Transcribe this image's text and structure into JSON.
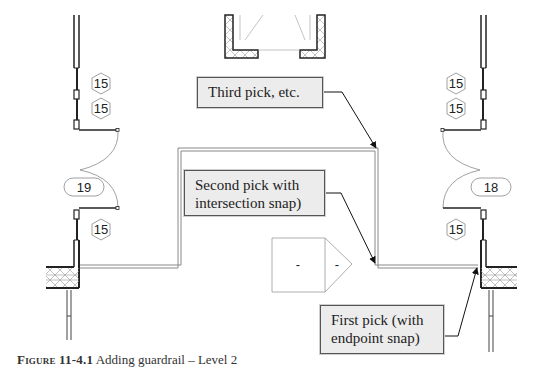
{
  "callouts": {
    "third_pick": "Third pick, etc.",
    "second_pick_line1": "Second pick with",
    "second_pick_line2": "intersection snap)",
    "first_pick_line1": "First pick (with",
    "first_pick_line2": "endpoint snap)"
  },
  "tags": {
    "left_window_top": "15",
    "left_window_mid": "15",
    "left_door": "19",
    "left_window_bottom": "15",
    "right_window_top": "15",
    "right_window_mid": "15",
    "right_door": "18",
    "right_window_bottom": "15"
  },
  "room_tag": {
    "left_value": "-",
    "right_value": "-"
  },
  "caption": {
    "figure_label": "Figure 11-4.1",
    "text": " Adding guardrail – Level 2"
  }
}
